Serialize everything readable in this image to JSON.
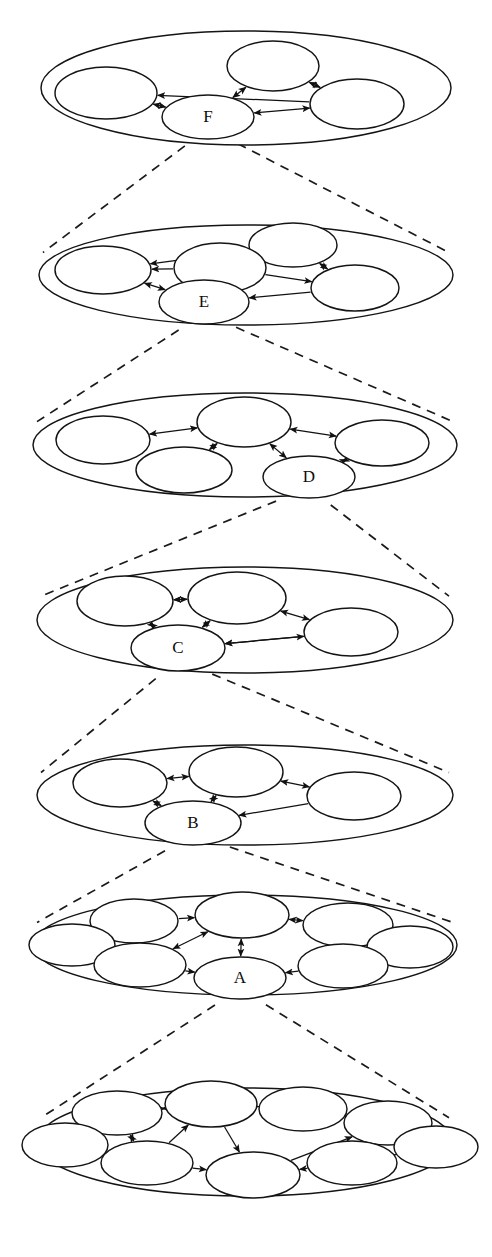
{
  "figure": {
    "stroke_color": "#141414",
    "background_color": "#ffffff",
    "edge_color": "#111111",
    "dash_color": "#1a1a1a"
  },
  "chart_data": {
    "type": "diagram",
    "levels": [
      {
        "id": "level-F",
        "label": "F",
        "node_count": 4,
        "labeled_node_index": 3,
        "outer": {
          "cx": 246,
          "cy": 88,
          "rx": 205,
          "ry": 57
        },
        "nodes": [
          {
            "cx": 106,
            "cy": 93,
            "rx": 51,
            "ry": 26,
            "label": ""
          },
          {
            "cx": 273,
            "cy": 66,
            "rx": 46,
            "ry": 25,
            "label": ""
          },
          {
            "cx": 357,
            "cy": 104,
            "rx": 47,
            "ry": 25,
            "label": ""
          },
          {
            "cx": 208,
            "cy": 117,
            "rx": 46,
            "ry": 22,
            "label": "F"
          }
        ],
        "edges": [
          {
            "from": 3,
            "to": 1,
            "arrows": "both"
          },
          {
            "from": 1,
            "to": 2,
            "arrows": "both"
          },
          {
            "from": 2,
            "to": 0,
            "arrows": "to"
          },
          {
            "from": 0,
            "to": 3,
            "arrows": "both"
          },
          {
            "from": 3,
            "to": 2,
            "arrows": "both"
          }
        ]
      },
      {
        "id": "level-E",
        "label": "E",
        "node_count": 5,
        "labeled_node_index": 4,
        "outer": {
          "cx": 246,
          "cy": 275,
          "rx": 207,
          "ry": 50
        },
        "nodes": [
          {
            "cx": 293,
            "cy": 245,
            "rx": 44,
            "ry": 22
          },
          {
            "cx": 220,
            "cy": 268,
            "rx": 46,
            "ry": 25
          },
          {
            "cx": 103,
            "cy": 270,
            "rx": 48,
            "ry": 24
          },
          {
            "cx": 355,
            "cy": 288,
            "rx": 44,
            "ry": 23
          },
          {
            "cx": 204,
            "cy": 302,
            "rx": 45,
            "ry": 22,
            "label": "E"
          }
        ],
        "edges": [
          {
            "from": 0,
            "to": 2,
            "arrows": "to"
          },
          {
            "from": 1,
            "to": 2,
            "arrows": "to"
          },
          {
            "from": 0,
            "to": 3,
            "arrows": "both"
          },
          {
            "from": 1,
            "to": 3,
            "arrows": "to"
          },
          {
            "from": 2,
            "to": 4,
            "arrows": "both"
          },
          {
            "from": 3,
            "to": 4,
            "arrows": "to"
          }
        ]
      },
      {
        "id": "level-D",
        "label": "D",
        "node_count": 5,
        "labeled_node_index": 4,
        "outer": {
          "cx": 245,
          "cy": 445,
          "rx": 212,
          "ry": 52
        },
        "nodes": [
          {
            "cx": 244,
            "cy": 422,
            "rx": 47,
            "ry": 25
          },
          {
            "cx": 103,
            "cy": 440,
            "rx": 47,
            "ry": 24
          },
          {
            "cx": 184,
            "cy": 470,
            "rx": 48,
            "ry": 23
          },
          {
            "cx": 382,
            "cy": 443,
            "rx": 47,
            "ry": 23
          },
          {
            "cx": 309,
            "cy": 477,
            "rx": 46,
            "ry": 21,
            "label": "D"
          }
        ],
        "edges": [
          {
            "from": 0,
            "to": 1,
            "arrows": "both"
          },
          {
            "from": 0,
            "to": 2,
            "arrows": "both"
          },
          {
            "from": 3,
            "to": 0,
            "arrows": "both"
          },
          {
            "from": 0,
            "to": 4,
            "arrows": "both"
          },
          {
            "from": 4,
            "to": 3,
            "arrows": "both"
          }
        ]
      },
      {
        "id": "level-C",
        "label": "C",
        "node_count": 4,
        "labeled_node_index": 3,
        "outer": {
          "cx": 245,
          "cy": 620,
          "rx": 208,
          "ry": 53
        },
        "nodes": [
          {
            "cx": 125,
            "cy": 601,
            "rx": 48,
            "ry": 25
          },
          {
            "cx": 237,
            "cy": 598,
            "rx": 49,
            "ry": 26
          },
          {
            "cx": 351,
            "cy": 632,
            "rx": 47,
            "ry": 24
          },
          {
            "cx": 178,
            "cy": 648,
            "rx": 47,
            "ry": 23,
            "label": "C"
          }
        ],
        "edges": [
          {
            "from": 0,
            "to": 1,
            "arrows": "both"
          },
          {
            "from": 1,
            "to": 0,
            "arrows": "to"
          },
          {
            "from": 3,
            "to": 1,
            "arrows": "both"
          },
          {
            "from": 1,
            "to": 2,
            "arrows": "both"
          },
          {
            "from": 3,
            "to": 2,
            "arrows": "both"
          },
          {
            "from": 2,
            "to": 3,
            "arrows": "to"
          },
          {
            "from": 0,
            "to": 3,
            "arrows": "both"
          }
        ]
      },
      {
        "id": "level-B",
        "label": "B",
        "node_count": 4,
        "labeled_node_index": 3,
        "outer": {
          "cx": 245,
          "cy": 795,
          "rx": 208,
          "ry": 50
        },
        "nodes": [
          {
            "cx": 120,
            "cy": 783,
            "rx": 47,
            "ry": 24
          },
          {
            "cx": 236,
            "cy": 772,
            "rx": 47,
            "ry": 25
          },
          {
            "cx": 354,
            "cy": 796,
            "rx": 47,
            "ry": 24
          },
          {
            "cx": 193,
            "cy": 823,
            "rx": 48,
            "ry": 22,
            "label": "B"
          }
        ],
        "edges": [
          {
            "from": 0,
            "to": 1,
            "arrows": "both"
          },
          {
            "from": 3,
            "to": 1,
            "arrows": "both"
          },
          {
            "from": 1,
            "to": 2,
            "arrows": "both"
          },
          {
            "from": 0,
            "to": 3,
            "arrows": "both"
          },
          {
            "from": 2,
            "to": 3,
            "arrows": "to"
          }
        ]
      },
      {
        "id": "level-A",
        "label": "A",
        "node_count": 8,
        "labeled_node_index": 7,
        "outer": {
          "cx": 245,
          "cy": 945,
          "rx": 212,
          "ry": 50
        },
        "nodes": [
          {
            "cx": 134,
            "cy": 921,
            "rx": 44,
            "ry": 22
          },
          {
            "cx": 242,
            "cy": 915,
            "rx": 47,
            "ry": 23
          },
          {
            "cx": 348,
            "cy": 925,
            "rx": 45,
            "ry": 22
          },
          {
            "cx": 72,
            "cy": 945,
            "rx": 43,
            "ry": 21
          },
          {
            "cx": 410,
            "cy": 947,
            "rx": 43,
            "ry": 21
          },
          {
            "cx": 140,
            "cy": 965,
            "rx": 46,
            "ry": 22
          },
          {
            "cx": 343,
            "cy": 966,
            "rx": 45,
            "ry": 22
          },
          {
            "cx": 240,
            "cy": 978,
            "rx": 46,
            "ry": 21,
            "label": "A"
          }
        ],
        "edges": [
          {
            "from": 0,
            "to": 3,
            "arrows": "both"
          },
          {
            "from": 0,
            "to": 1,
            "arrows": "to"
          },
          {
            "from": 0,
            "to": 5,
            "arrows": "both"
          },
          {
            "from": 3,
            "to": 5,
            "arrows": "to"
          },
          {
            "from": 5,
            "to": 1,
            "arrows": "both"
          },
          {
            "from": 2,
            "to": 1,
            "arrows": "both"
          },
          {
            "from": 2,
            "to": 4,
            "arrows": "both"
          },
          {
            "from": 2,
            "to": 6,
            "arrows": "to"
          },
          {
            "from": 6,
            "to": 4,
            "arrows": "both"
          },
          {
            "from": 1,
            "to": 7,
            "arrows": "both"
          },
          {
            "from": 5,
            "to": 7,
            "arrows": "to"
          },
          {
            "from": 6,
            "to": 7,
            "arrows": "to"
          }
        ]
      },
      {
        "id": "level-base",
        "label": "",
        "node_count": 9,
        "labeled_node_index": -1,
        "outer": {
          "cx": 245,
          "cy": 1142,
          "rx": 208,
          "ry": 54
        },
        "nodes": [
          {
            "cx": 117,
            "cy": 1113,
            "rx": 45,
            "ry": 22
          },
          {
            "cx": 211,
            "cy": 1104,
            "rx": 46,
            "ry": 23
          },
          {
            "cx": 303,
            "cy": 1109,
            "rx": 44,
            "ry": 22
          },
          {
            "cx": 388,
            "cy": 1123,
            "rx": 44,
            "ry": 22
          },
          {
            "cx": 65,
            "cy": 1145,
            "rx": 43,
            "ry": 22
          },
          {
            "cx": 436,
            "cy": 1147,
            "rx": 42,
            "ry": 21
          },
          {
            "cx": 147,
            "cy": 1163,
            "rx": 46,
            "ry": 22
          },
          {
            "cx": 253,
            "cy": 1175,
            "rx": 47,
            "ry": 23
          },
          {
            "cx": 352,
            "cy": 1163,
            "rx": 45,
            "ry": 22
          }
        ],
        "edges": [
          {
            "from": 4,
            "to": 0,
            "arrows": "to"
          },
          {
            "from": 0,
            "to": 1,
            "arrows": "both"
          },
          {
            "from": 1,
            "to": 2,
            "arrows": "both"
          },
          {
            "from": 2,
            "to": 3,
            "arrows": "to"
          },
          {
            "from": 0,
            "to": 6,
            "arrows": "both"
          },
          {
            "from": 4,
            "to": 6,
            "arrows": "to"
          },
          {
            "from": 6,
            "to": 1,
            "arrows": "to"
          },
          {
            "from": 1,
            "to": 7,
            "arrows": "to"
          },
          {
            "from": 6,
            "to": 7,
            "arrows": "to"
          },
          {
            "from": 3,
            "to": 8,
            "arrows": "to"
          },
          {
            "from": 3,
            "to": 5,
            "arrows": "to"
          },
          {
            "from": 8,
            "to": 5,
            "arrows": "to"
          },
          {
            "from": 8,
            "to": 7,
            "arrows": "to"
          },
          {
            "from": 7,
            "to": 3,
            "arrows": "to"
          }
        ]
      }
    ],
    "zoom_links": [
      {
        "from_level": "level-F",
        "to_level": "level-E",
        "from_label": "F"
      },
      {
        "from_level": "level-E",
        "to_level": "level-D",
        "from_label": "E"
      },
      {
        "from_level": "level-D",
        "to_level": "level-C",
        "from_label": "D"
      },
      {
        "from_level": "level-C",
        "to_level": "level-B",
        "from_label": "C"
      },
      {
        "from_level": "level-B",
        "to_level": "level-A",
        "from_label": "B"
      },
      {
        "from_level": "level-A",
        "to_level": "level-base",
        "from_label": "A"
      }
    ]
  }
}
